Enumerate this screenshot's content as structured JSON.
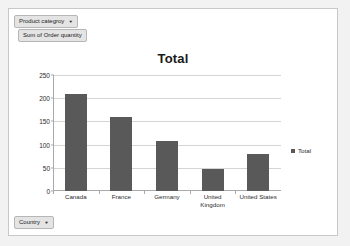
{
  "pivot_buttons": {
    "category_filter": {
      "label": "Product categroy",
      "caret": "chevron-down-icon"
    },
    "value_field": {
      "label": "Sum of Order quantity"
    },
    "axis_filter": {
      "label": "Country",
      "caret": "chevron-down-icon"
    }
  },
  "legend": {
    "entries": [
      "Total"
    ]
  },
  "chart_data": {
    "type": "bar",
    "title": "Total",
    "xlabel": "",
    "ylabel": "",
    "categories": [
      "Canada",
      "France",
      "Germany",
      "United Kingdom",
      "United States"
    ],
    "values": [
      210,
      160,
      107,
      48,
      80
    ],
    "series": [
      {
        "name": "Total",
        "values": [
          210,
          160,
          107,
          48,
          80
        ]
      }
    ],
    "ylim": [
      0,
      250
    ],
    "yticks": [
      0,
      50,
      100,
      150,
      200,
      250
    ],
    "grid": true,
    "legend_position": "right",
    "bar_color": "#595959"
  }
}
